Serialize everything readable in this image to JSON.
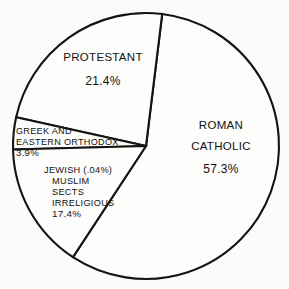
{
  "chart_data": {
    "type": "pie",
    "title": "",
    "subtitle": "",
    "xlabel": "",
    "ylabel": "",
    "legend_position": "none",
    "grid": false,
    "units": "percent",
    "categories": [
      "ROMAN CATHOLIC",
      "PROTESTANT",
      "GREEK AND EASTERN ORTHODOX",
      "JEWISH (.04%) MUSLIM SECTS IRRELIGIOUS"
    ],
    "values": [
      57.3,
      21.4,
      3.9,
      17.4
    ],
    "slices": [
      {
        "name": "ROMAN CATHOLIC",
        "value": 57.3,
        "value_label": "57.3%",
        "label_lines": [
          "ROMAN",
          "CATHOLIC"
        ],
        "start_angle": 7.0,
        "end_angle": 213.3,
        "fill": "#fdfdfc"
      },
      {
        "name": "PROTESTANT",
        "value": 21.4,
        "value_label": "21.4%",
        "label_lines": [
          "PROTESTANT"
        ],
        "start_angle": 282.5,
        "end_angle": 7.0,
        "fill": "#fdfdfc"
      },
      {
        "name": "GREEK AND EASTERN ORTHODOX",
        "value": 3.9,
        "value_label": "3.9%",
        "label_lines": [
          "GREEK AND",
          "EASTERN ORTHODOX"
        ],
        "start_angle": 268.5,
        "end_angle": 282.5,
        "fill": "#fdfdfc"
      },
      {
        "name": "JEWISH MUSLIM SECTS IRRELIGIOUS",
        "value": 17.4,
        "value_label": "17.4%",
        "label_lines": [
          "JEWISH (.04%)",
          "MUSLIM",
          "SECTS",
          "IRRELIGIOUS"
        ],
        "start_angle": 213.3,
        "end_angle": 268.5,
        "fill": "#fdfdfc"
      }
    ]
  },
  "geometry": {
    "center_x": 146,
    "center_y": 146,
    "radius": 133
  },
  "colors": {
    "background": "#fbfbf9",
    "outline": "#141414",
    "slice_fill": "#fdfdfc",
    "text": "#111111"
  },
  "labels": {
    "catholic": {
      "line1": "ROMAN",
      "line2": "CATHOLIC",
      "percent": "57.3%"
    },
    "protestant": {
      "line1": "PROTESTANT",
      "percent": "21.4%"
    },
    "orthodox": {
      "line1": "GREEK AND",
      "line2": "EASTERN ORTHODOX",
      "percent": "3.9%"
    },
    "other": {
      "line1": "JEWISH (.04%)",
      "line2": "MUSLIM",
      "line3": "SECTS",
      "line4": "IRRELIGIOUS",
      "percent": "17.4%"
    }
  }
}
